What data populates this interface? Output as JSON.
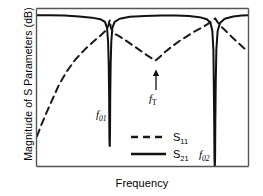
{
  "chart_data": {
    "type": "line",
    "title": "",
    "xlabel": "Frequency",
    "ylabel": "Magnitude of S Parameters (dB)",
    "xticklabels": [],
    "yticklabels": [],
    "grid": false,
    "legend_position": "lower-center",
    "axis_style": "box-frame-no-ticks",
    "annotations": [
      {
        "name": "f01",
        "label": "f01",
        "label_base": "f",
        "label_sub": "01",
        "meaning": "first resonant notch frequency of S21",
        "x_frac": 0.33,
        "y_frac": 0.0,
        "has_arrow": false
      },
      {
        "name": "f02",
        "label": "f02",
        "label_base": "f",
        "label_sub": "02",
        "meaning": "second resonant notch frequency of S21",
        "x_frac": 0.82,
        "y_frac": 0.0,
        "has_arrow": false
      },
      {
        "name": "fT",
        "label": "fT",
        "label_base": "f",
        "label_sub": "T",
        "meaning": "transmission zero / S11 local minimum between the two notches",
        "x_frac": 0.565,
        "y_frac": 0.64,
        "has_arrow": true
      }
    ],
    "series": [
      {
        "name": "S11",
        "label_base": "S",
        "label_sub": "11",
        "style": "dashed",
        "color": "#1a1a1a",
        "linewidth": 2.0,
        "description": "Reflection coefficient: rises steeply from a low value at the left edge toward the top, dips sharply to a deep null at f01, climbs back to near the top, descends into a V-shaped local minimum at fT, rises back to the top, dips to a null at f02, then falls away toward the right edge.",
        "points": [
          [
            0.0,
            0.19
          ],
          [
            0.02,
            0.26
          ],
          [
            0.045,
            0.34
          ],
          [
            0.075,
            0.43
          ],
          [
            0.105,
            0.52
          ],
          [
            0.14,
            0.6
          ],
          [
            0.18,
            0.675
          ],
          [
            0.225,
            0.74
          ],
          [
            0.265,
            0.79
          ],
          [
            0.3,
            0.83
          ],
          [
            0.325,
            0.862
          ],
          [
            0.338,
            0.893
          ],
          [
            0.345,
            0.93
          ],
          [
            0.35,
            0.88
          ],
          [
            0.362,
            0.845
          ],
          [
            0.385,
            0.83
          ],
          [
            0.42,
            0.8
          ],
          [
            0.455,
            0.768
          ],
          [
            0.49,
            0.735
          ],
          [
            0.52,
            0.706
          ],
          [
            0.548,
            0.682
          ],
          [
            0.562,
            0.672
          ],
          [
            0.578,
            0.69
          ],
          [
            0.605,
            0.724
          ],
          [
            0.64,
            0.762
          ],
          [
            0.675,
            0.796
          ],
          [
            0.71,
            0.826
          ],
          [
            0.745,
            0.855
          ],
          [
            0.78,
            0.88
          ],
          [
            0.81,
            0.905
          ],
          [
            0.83,
            0.925
          ],
          [
            0.845,
            0.94
          ],
          [
            0.855,
            0.918
          ],
          [
            0.872,
            0.89
          ],
          [
            0.895,
            0.86
          ],
          [
            0.925,
            0.82
          ],
          [
            0.955,
            0.782
          ],
          [
            0.98,
            0.752
          ],
          [
            1.0,
            0.73
          ]
        ]
      },
      {
        "name": "S21",
        "label_base": "S",
        "label_sub": "21",
        "style": "solid",
        "color": "#111111",
        "linewidth": 2.0,
        "description": "Transmission coefficient: flat near the top (0 dB) across the band, with two very deep narrow notches — a moderately deep null at f01 and a deeper null at f02.",
        "points": [
          [
            0.0,
            0.96
          ],
          [
            0.06,
            0.96
          ],
          [
            0.13,
            0.958
          ],
          [
            0.2,
            0.953
          ],
          [
            0.26,
            0.945
          ],
          [
            0.3,
            0.935
          ],
          [
            0.322,
            0.918
          ],
          [
            0.332,
            0.88
          ],
          [
            0.337,
            0.79
          ],
          [
            0.34,
            0.64
          ],
          [
            0.342,
            0.44
          ],
          [
            0.343,
            0.2
          ],
          [
            0.344,
            0.13
          ],
          [
            0.345,
            0.128
          ],
          [
            0.346,
            0.2
          ],
          [
            0.347,
            0.44
          ],
          [
            0.349,
            0.64
          ],
          [
            0.352,
            0.79
          ],
          [
            0.357,
            0.88
          ],
          [
            0.368,
            0.918
          ],
          [
            0.392,
            0.938
          ],
          [
            0.44,
            0.95
          ],
          [
            0.51,
            0.956
          ],
          [
            0.59,
            0.958
          ],
          [
            0.66,
            0.958
          ],
          [
            0.72,
            0.955
          ],
          [
            0.77,
            0.948
          ],
          [
            0.805,
            0.935
          ],
          [
            0.822,
            0.912
          ],
          [
            0.831,
            0.86
          ],
          [
            0.836,
            0.74
          ],
          [
            0.838,
            0.52
          ],
          [
            0.84,
            0.25
          ],
          [
            0.841,
            0.05
          ],
          [
            0.842,
            0.005
          ],
          [
            0.843,
            0.005
          ],
          [
            0.844,
            0.05
          ],
          [
            0.845,
            0.25
          ],
          [
            0.847,
            0.52
          ],
          [
            0.85,
            0.74
          ],
          [
            0.856,
            0.86
          ],
          [
            0.868,
            0.912
          ],
          [
            0.89,
            0.938
          ],
          [
            0.93,
            0.952
          ],
          [
            0.97,
            0.958
          ],
          [
            1.0,
            0.96
          ]
        ]
      }
    ],
    "legend": [
      {
        "name": "S11",
        "label_base": "S",
        "label_sub": "11",
        "style": "dashed"
      },
      {
        "name": "S21",
        "label_base": "S",
        "label_sub": "21",
        "style": "solid"
      }
    ],
    "colors": {
      "ink": "#111111",
      "frame": "#555555",
      "background": "#ffffff"
    }
  }
}
